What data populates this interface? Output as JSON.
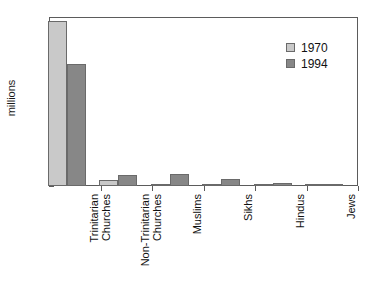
{
  "chart_data": {
    "type": "bar",
    "title": "",
    "xlabel": "",
    "ylabel": "millions",
    "ylim": [
      0,
      9
    ],
    "yticks": [
      0,
      1,
      2,
      3,
      4,
      5,
      6,
      7,
      8,
      9
    ],
    "ytick_labels": [
      "0",
      "1",
      "2",
      "3",
      "4",
      "5",
      "6",
      "7",
      "8",
      "9"
    ],
    "grid": false,
    "legend_position": "top-right",
    "categories": [
      "Trinitarian\nChurches",
      "Non-Trinitarian\nChurches",
      "Muslims",
      "Sikhs",
      "Hindus",
      "Jews"
    ],
    "series": [
      {
        "name": "1970",
        "color": "#c9c9c9",
        "values": [
          8.8,
          0.3,
          0.12,
          0.08,
          0.08,
          0.1
        ]
      },
      {
        "name": "1994",
        "color": "#878787",
        "values": [
          6.5,
          0.6,
          0.65,
          0.4,
          0.14,
          0.11
        ]
      }
    ]
  },
  "legend": {
    "entries": [
      {
        "label": "1970",
        "color": "#c9c9c9"
      },
      {
        "label": "1994",
        "color": "#878787"
      }
    ]
  },
  "axis": {
    "y_title": "millions"
  }
}
